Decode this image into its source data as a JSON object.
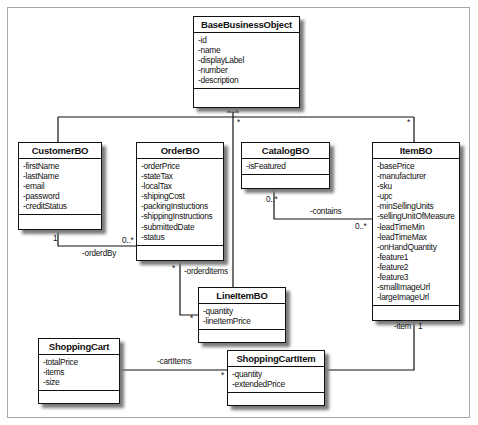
{
  "diagram": {
    "type": "UML class diagram",
    "classes": [
      {
        "id": "base",
        "name": "BaseBusinessObject",
        "attributes": [
          "-id",
          "-name",
          "-displayLabel",
          "-number",
          "-description"
        ]
      },
      {
        "id": "customer",
        "name": "CustomerBO",
        "attributes": [
          "-firstName",
          "-lastName",
          "-email",
          "-password",
          "-creditStatus"
        ]
      },
      {
        "id": "order",
        "name": "OrderBO",
        "attributes": [
          "-orderPrice",
          "-stateTax",
          "-localTax",
          "-shipingCost",
          "-packingInstuctions",
          "-shippingInstructions",
          "-submittedDate",
          "-status"
        ]
      },
      {
        "id": "catalog",
        "name": "CatalogBO",
        "attributes": [
          "-isFeatured"
        ]
      },
      {
        "id": "item",
        "name": "ItemBO",
        "attributes": [
          "-basePrice",
          "-manufacturer",
          "-sku",
          "-upc",
          "-minSellingUnits",
          "-sellingUnitOfMeasure",
          "-leadTimeMin",
          "-leadTimeMax",
          "-onHandQuantity",
          "-feature1",
          "-feature2",
          "-feature3",
          "-smallImageUrl",
          "-largeImageUrl"
        ]
      },
      {
        "id": "lineitem",
        "name": "LineItemBO",
        "attributes": [
          "-quantity",
          "-lineItemPrice"
        ]
      },
      {
        "id": "cart",
        "name": "ShoppingCart",
        "attributes": [
          "-totalPrice",
          "-items",
          "-size"
        ]
      },
      {
        "id": "cartitem",
        "name": "ShoppingCartItem",
        "attributes": [
          "-quantity",
          "-extendedPrice"
        ]
      }
    ],
    "relationships": [
      {
        "type": "generalization",
        "from": [
          "CustomerBO",
          "OrderBO",
          "CatalogBO",
          "ItemBO",
          "LineItemBO"
        ],
        "to": "BaseBusinessObject",
        "multiplicities": [
          "*",
          "*"
        ]
      },
      {
        "type": "association",
        "from": "CustomerBO",
        "to": "OrderBO",
        "label": "-orderdBy",
        "from_mult": "1",
        "to_mult": "0..*"
      },
      {
        "type": "association",
        "from": "OrderBO",
        "to": "LineItemBO",
        "label": "-orderdItems",
        "from_mult": "*",
        "to_mult": "*"
      },
      {
        "type": "association",
        "from": "CatalogBO",
        "to": "ItemBO",
        "label": "-contains",
        "from_mult": "0..*",
        "to_mult": "0..*"
      },
      {
        "type": "association",
        "from": "ShoppingCart",
        "to": "ShoppingCartItem",
        "label": "-cartItems",
        "to_mult": "*"
      },
      {
        "type": "association",
        "from": "ItemBO",
        "to": "ShoppingCartItem",
        "label": "-item",
        "from_mult": "1"
      }
    ]
  },
  "labels": {
    "gen_star_left": "*",
    "gen_star_right": "*",
    "orderdBy": "-orderdBy",
    "orderdBy_one": "1",
    "orderdBy_many": "0..*",
    "orderdItems": "-orderdItems",
    "orderdItems_star_top": "*",
    "orderdItems_star_bottom": "*",
    "contains": "-contains",
    "contains_left": "0..*",
    "contains_right": "0..*",
    "cartItems": "-cartItems",
    "cartItems_star": "*",
    "item": "-item",
    "item_one": "1"
  }
}
